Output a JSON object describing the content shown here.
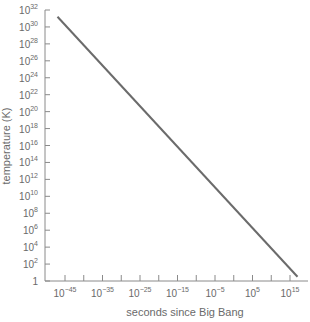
{
  "chart_data": {
    "type": "line",
    "title": "",
    "xlabel": "seconds since Big Bang",
    "ylabel": "temperature (K)",
    "xscale": "log",
    "yscale": "log",
    "x_tick_labels": [
      "10^-45",
      "10^-35",
      "10^-25",
      "10^-15",
      "10^-5",
      "10^5",
      "10^15"
    ],
    "x_tick_exponents": [
      -45,
      -35,
      -25,
      -15,
      -5,
      5,
      15
    ],
    "y_tick_labels": [
      "1",
      "10^2",
      "10^4",
      "10^6",
      "10^8",
      "10^10",
      "10^12",
      "10^14",
      "10^16",
      "10^18",
      "10^20",
      "10^22",
      "10^24",
      "10^26",
      "10^28",
      "10^30",
      "10^32"
    ],
    "y_tick_exponents": [
      0,
      2,
      4,
      6,
      8,
      10,
      12,
      14,
      16,
      18,
      20,
      22,
      24,
      26,
      28,
      30,
      32
    ],
    "xlim_exponent": [
      -45,
      17
    ],
    "ylim_exponent": [
      0,
      32
    ],
    "grid": false,
    "legend": null,
    "series": [
      {
        "name": "temperature",
        "color": "#6b6b6b",
        "points_log10": [
          {
            "x": -47,
            "y": 31.2
          },
          {
            "x": 17,
            "y": 0.5
          }
        ]
      }
    ]
  },
  "colors": {
    "axis": "#8a8a8a",
    "line": "#6b6b6b",
    "text": "#6a6a6a",
    "background": "#ffffff"
  }
}
